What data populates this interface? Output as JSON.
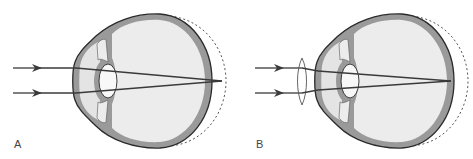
{
  "figure": {
    "panels": [
      {
        "id": "A",
        "label": "A",
        "description": "Hyperopic (short) eye: parallel rays focus behind the retina; dashed outline shows normal eye length",
        "lens": false
      },
      {
        "id": "B",
        "label": "B",
        "description": "Correction with a convex (converging) lens: rays focus on the retina",
        "lens": true
      }
    ]
  },
  "colors": {
    "outline": "#2a2a2a",
    "sclera": "#9a9a9a",
    "interior": "#ececec",
    "ray": "#3a3a3a",
    "dashed": "#555555"
  }
}
